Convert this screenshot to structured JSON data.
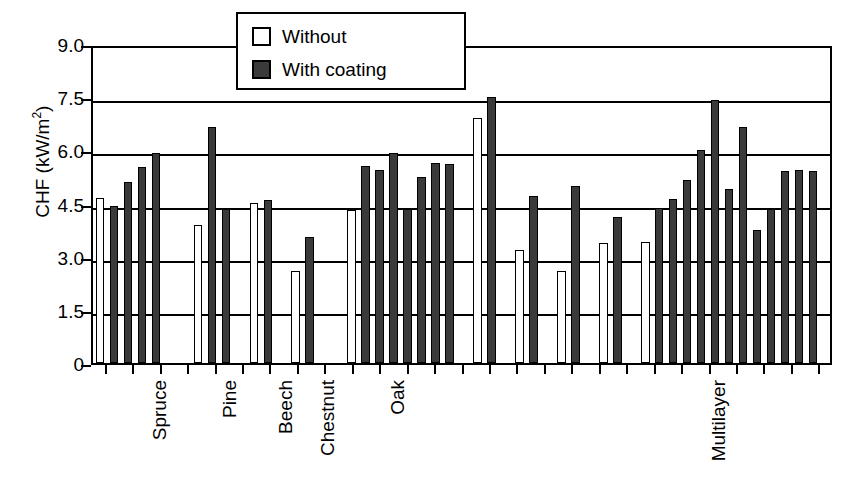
{
  "chart_data": {
    "type": "bar",
    "title": "",
    "subtitle": "",
    "xlabel": "",
    "ylabel": "CHF (kW/m2)",
    "ylabel_prefix": "CHF (kW/m",
    "ylabel_sup": "2",
    "ylabel_suffix": ")",
    "ylim": [
      0,
      9.0
    ],
    "ytick_labels": [
      "9.0",
      "7.5",
      "6.0",
      "4.5",
      "3.0",
      "1.5",
      "0"
    ],
    "ytick_values": [
      9.0,
      7.5,
      6.0,
      4.5,
      3.0,
      1.5,
      0
    ],
    "grid": "horizontal",
    "legend_position": "top-center",
    "legend": [
      {
        "key": "without",
        "label": "Without",
        "color": "#ffffff"
      },
      {
        "key": "with",
        "label": "With coating",
        "color": "#3a3a3a"
      }
    ],
    "group_labels": [
      "Spruce",
      "Pine",
      "Beech",
      "Chestnut",
      "Oak",
      "Multilayer"
    ],
    "groups": [
      {
        "name": "Spruce",
        "label_slot": 3,
        "bars": [
          {
            "series": "without",
            "value": 4.65,
            "slot": 0
          },
          {
            "series": "with",
            "value": 4.42,
            "slot": 1
          },
          {
            "series": "with",
            "value": 5.12,
            "slot": 2
          },
          {
            "series": "with",
            "value": 5.52,
            "slot": 3
          },
          {
            "series": "with",
            "value": 5.92,
            "slot": 4
          }
        ]
      },
      {
        "name": "Pine",
        "label_slot": 8,
        "bars": [
          {
            "series": "without",
            "value": 3.9,
            "slot": 7
          },
          {
            "series": "with",
            "value": 6.65,
            "slot": 8
          },
          {
            "series": "with",
            "value": 4.35,
            "slot": 9
          }
        ]
      },
      {
        "name": "Beech",
        "label_slot": 12,
        "bars": [
          {
            "series": "without",
            "value": 4.52,
            "slot": 11
          },
          {
            "series": "with",
            "value": 4.6,
            "slot": 12
          }
        ]
      },
      {
        "name": "Chestnut",
        "label_slot": 15,
        "bars": [
          {
            "series": "without",
            "value": 2.6,
            "slot": 14
          },
          {
            "series": "with",
            "value": 3.55,
            "slot": 15
          }
        ]
      },
      {
        "name": "Oak",
        "label_slot": 20,
        "bars": [
          {
            "series": "without",
            "value": 4.33,
            "slot": 18
          },
          {
            "series": "with",
            "value": 5.55,
            "slot": 19
          },
          {
            "series": "with",
            "value": 5.45,
            "slot": 20
          },
          {
            "series": "with",
            "value": 5.92,
            "slot": 21
          },
          {
            "series": "with",
            "value": 4.35,
            "slot": 22
          },
          {
            "series": "with",
            "value": 5.25,
            "slot": 23
          },
          {
            "series": "with",
            "value": 5.65,
            "slot": 24
          },
          {
            "series": "with",
            "value": 5.62,
            "slot": 25
          }
        ]
      },
      {
        "name": "unlabeled-1",
        "label_slot": -1,
        "bars": [
          {
            "series": "without",
            "value": 6.92,
            "slot": 27
          },
          {
            "series": "with",
            "value": 7.5,
            "slot": 28
          }
        ]
      },
      {
        "name": "unlabeled-2",
        "label_slot": -1,
        "bars": [
          {
            "series": "without",
            "value": 3.18,
            "slot": 30
          },
          {
            "series": "with",
            "value": 4.7,
            "slot": 31
          }
        ]
      },
      {
        "name": "unlabeled-3",
        "label_slot": -1,
        "bars": [
          {
            "series": "without",
            "value": 2.6,
            "slot": 33
          },
          {
            "series": "with",
            "value": 5.0,
            "slot": 34
          }
        ]
      },
      {
        "name": "unlabeled-4",
        "label_slot": -1,
        "bars": [
          {
            "series": "without",
            "value": 3.4,
            "slot": 36
          },
          {
            "series": "with",
            "value": 4.12,
            "slot": 37
          }
        ]
      },
      {
        "name": "Multilayer",
        "label_slot": 43,
        "bars": [
          {
            "series": "without",
            "value": 3.42,
            "slot": 39
          },
          {
            "series": "with",
            "value": 4.38,
            "slot": 40
          },
          {
            "series": "with",
            "value": 4.62,
            "slot": 41
          },
          {
            "series": "with",
            "value": 5.15,
            "slot": 42
          },
          {
            "series": "with",
            "value": 6.02,
            "slot": 43
          },
          {
            "series": "with",
            "value": 7.42,
            "slot": 44
          },
          {
            "series": "with",
            "value": 4.9,
            "slot": 45
          },
          {
            "series": "with",
            "value": 6.65,
            "slot": 46
          },
          {
            "series": "with",
            "value": 3.75,
            "slot": 47
          },
          {
            "series": "with",
            "value": 4.35,
            "slot": 48
          },
          {
            "series": "with",
            "value": 5.42,
            "slot": 49
          },
          {
            "series": "with",
            "value": 5.45,
            "slot": 50
          },
          {
            "series": "with",
            "value": 5.42,
            "slot": 51
          }
        ]
      }
    ],
    "slot_count": 53,
    "x_tick_count": 27
  }
}
